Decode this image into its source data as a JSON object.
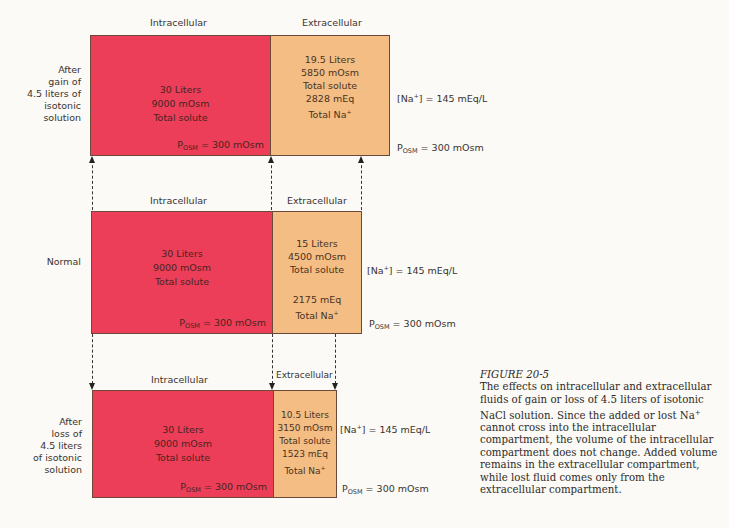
{
  "panels": [
    {
      "id": "gain",
      "row_label": [
        "After",
        "gain of",
        "4.5 liters of",
        "isotonic",
        "solution"
      ],
      "intracellular": {
        "header": "Intracellular",
        "lines": [
          "30 Liters",
          "9000 mOsm",
          "Total solute"
        ],
        "posm_prefix": "P",
        "posm_sub": "OSM",
        "posm_value": " = 300 mOsm"
      },
      "extracellular": {
        "header": "Extracellular",
        "lines": [
          "19.5 Liters",
          "5850 mOsm",
          "Total solute",
          "2828 mEq",
          "Total Na"
        ]
      },
      "na_conc": "= 145 mEq/L",
      "posm_prefix": "P",
      "posm_sub": "OSM",
      "posm_value": " = 300 mOsm"
    },
    {
      "id": "normal",
      "row_label": [
        "Normal"
      ],
      "intracellular": {
        "header": "Intracellular",
        "lines": [
          "30 Liters",
          "9000 mOsm",
          "Total solute"
        ],
        "posm_prefix": "P",
        "posm_sub": "OSM",
        "posm_value": " = 300 mOsm"
      },
      "extracellular": {
        "header": "Extracellular",
        "lines": [
          "15 Liters",
          "4500 mOsm",
          "Total solute",
          "2175 mEq",
          "Total Na"
        ]
      },
      "na_conc": "= 145 mEq/L",
      "posm_prefix": "P",
      "posm_sub": "OSM",
      "posm_value": " = 300 mOsm"
    },
    {
      "id": "loss",
      "row_label": [
        "After",
        "loss of",
        "4.5 liters",
        "of isotonic",
        "solution"
      ],
      "intracellular": {
        "header": "Intracellular",
        "lines": [
          "30 Liters",
          "9000 mOsm",
          "Total solute"
        ],
        "posm_prefix": "P",
        "posm_sub": "OSM",
        "posm_value": " = 300 mOsm"
      },
      "extracellular": {
        "header": "Extracellular",
        "lines": [
          "10.5 Liters",
          "3150 mOsm",
          "Total solute",
          "1523 mEq",
          "Total Na"
        ]
      },
      "na_conc": "= 145 mEq/L",
      "posm_prefix": "P",
      "posm_sub": "OSM",
      "posm_value": " = 300 mOsm"
    }
  ],
  "na_label": "[Na",
  "na_close": "]",
  "plus": "+",
  "caption": {
    "figure": "FIGURE 20-5",
    "text_a": "The effects on intracellular and extracellular fluids of gain or loss of 4.5 liters of isotonic NaCl solution. Since the added or lost Na",
    "text_sup": "+",
    "text_b": " cannot cross into the intracellular compartment, the volume of the intracellular compartment does not change. Added volume remains in the extracellular compartment, while lost fluid comes only from the extracellular compartment."
  },
  "colors": {
    "intracellular": "#ec3e58",
    "extracellular": "#f4bd84",
    "border": "#6b4a3a",
    "background": "#fbfaf6"
  }
}
